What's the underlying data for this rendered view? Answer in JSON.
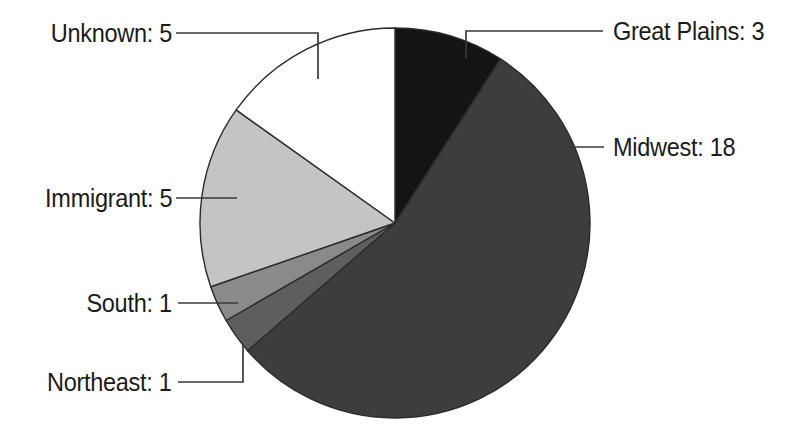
{
  "chart_data": {
    "type": "pie",
    "title": "",
    "total": 33,
    "start_angle_deg": 0,
    "direction": "clockwise",
    "categories": [
      "Great Plains",
      "Midwest",
      "Northeast",
      "South",
      "Immigrant",
      "Unknown"
    ],
    "values": [
      3,
      18,
      1,
      1,
      5,
      5
    ],
    "labels": [
      "Great Plains: 3",
      "Midwest: 18",
      "Northeast: 1",
      "South: 1",
      "Immigrant: 5",
      "Unknown: 5"
    ],
    "colors": [
      "#141414",
      "#3d3d3d",
      "#5e5e5e",
      "#8a8a8a",
      "#c4c4c4",
      "#ffffff"
    ],
    "legend": "none",
    "grid": false,
    "xlabel": "",
    "ylabel": "",
    "slices": [
      {
        "name": "Great Plains",
        "value": 3,
        "label": "Great Plains: 3",
        "color": "#141414",
        "percent": 9.1
      },
      {
        "name": "Midwest",
        "value": 18,
        "label": "Midwest: 18",
        "color": "#3d3d3d",
        "percent": 54.5
      },
      {
        "name": "Northeast",
        "value": 1,
        "label": "Northeast: 1",
        "color": "#5e5e5e",
        "percent": 3.0
      },
      {
        "name": "South",
        "value": 1,
        "label": "South: 1",
        "color": "#8a8a8a",
        "percent": 3.0
      },
      {
        "name": "Immigrant",
        "value": 5,
        "label": "Immigrant: 5",
        "color": "#c4c4c4",
        "percent": 15.2
      },
      {
        "name": "Unknown",
        "value": 5,
        "label": "Unknown: 5",
        "color": "#ffffff",
        "percent": 15.2
      }
    ]
  },
  "geometry": {
    "center_x": 395,
    "center_y": 223,
    "radius": 195
  },
  "labels": {
    "great_plains": "Great Plains: 3",
    "midwest": "Midwest: 18",
    "northeast": "Northeast: 1",
    "south": "South: 1",
    "immigrant": "Immigrant: 5",
    "unknown": "Unknown: 5"
  }
}
